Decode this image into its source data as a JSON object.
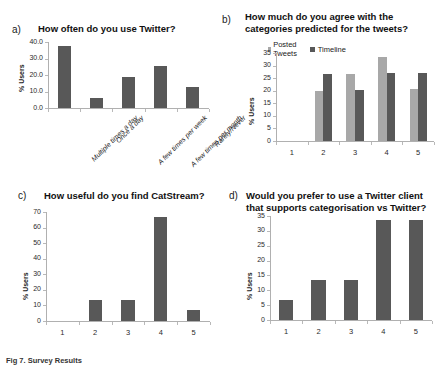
{
  "figure": {
    "caption": "Fig 7. Survey Results",
    "colors": {
      "bar_dark": "#585858",
      "bar_light": "#a8a8a8",
      "axis": "#b0b0b0",
      "text": "#1a1a1a"
    }
  },
  "panels": {
    "a": {
      "letter": "a)",
      "title": "How often do you use Twitter?"
    },
    "b": {
      "letter": "b)",
      "title_line1": "How much do you agree with the",
      "title_line2": "categories predicted for the tweets?"
    },
    "c": {
      "letter": "c)",
      "title": "How useful do you find CatStream?"
    },
    "d": {
      "letter": "d)",
      "title_line1": "Would you prefer to use a Twitter client",
      "title_line2": "that supports categorisation vs Twitter?"
    }
  },
  "chart_data": [
    {
      "id": "a",
      "type": "bar",
      "title": "How often do you use Twitter?",
      "xlabel": "",
      "ylabel": "% Users",
      "ylim": [
        0,
        40
      ],
      "yticks": [
        0,
        10,
        20,
        30,
        40
      ],
      "ytick_labels": [
        "0.0",
        "10.0",
        "20.0",
        "30.0",
        "40.0"
      ],
      "grid": false,
      "legend": null,
      "categories": [
        "Multiple times a day",
        "Once a day",
        "A few times per week",
        "A few times per month",
        "Rarely/Never"
      ],
      "values": [
        37.5,
        6.0,
        19.0,
        25.5,
        13.0
      ]
    },
    {
      "id": "b",
      "type": "bar",
      "title": "How much do you agree with the categories predicted for the tweets?",
      "xlabel": "",
      "ylabel": "% Users",
      "ylim": [
        0,
        35
      ],
      "yticks": [
        0,
        5,
        10,
        15,
        20,
        25,
        30,
        35
      ],
      "ytick_labels": [
        "0",
        "5",
        "10",
        "15",
        "20",
        "25",
        "30",
        "35"
      ],
      "grid": false,
      "legend": {
        "position": "top",
        "entries": [
          "Posted Tweets",
          "Timeline"
        ]
      },
      "categories": [
        "1",
        "2",
        "3",
        "4",
        "5"
      ],
      "series": [
        {
          "name": "Posted Tweets",
          "color": "#a8a8a8",
          "values": [
            0,
            20.0,
            26.7,
            33.5,
            20.5
          ]
        },
        {
          "name": "Timeline",
          "color": "#585858",
          "values": [
            0,
            26.8,
            20.3,
            27.0,
            27.2
          ]
        }
      ]
    },
    {
      "id": "c",
      "type": "bar",
      "title": "How useful do you find CatStream?",
      "xlabel": "",
      "ylabel": "% Users",
      "ylim": [
        0,
        70
      ],
      "yticks": [
        0,
        10,
        20,
        30,
        40,
        50,
        60,
        70
      ],
      "ytick_labels": [
        "0",
        "10",
        "20",
        "30",
        "40",
        "50",
        "60",
        "70"
      ],
      "grid": false,
      "legend": null,
      "categories": [
        "1",
        "2",
        "3",
        "4",
        "5"
      ],
      "values": [
        0,
        13.2,
        13.4,
        66.8,
        7.2
      ]
    },
    {
      "id": "d",
      "type": "bar",
      "title": "Would you prefer to use a Twitter client that supports categorisation vs Twitter?",
      "xlabel": "",
      "ylabel": "% Users",
      "ylim": [
        0,
        35
      ],
      "yticks": [
        0,
        5,
        10,
        15,
        20,
        25,
        30,
        35
      ],
      "ytick_labels": [
        "0",
        "5",
        "10",
        "15",
        "20",
        "25",
        "30",
        "35"
      ],
      "grid": false,
      "legend": null,
      "categories": [
        "1",
        "2",
        "3",
        "4",
        "5"
      ],
      "values": [
        6.7,
        13.3,
        13.4,
        33.6,
        33.7
      ]
    }
  ],
  "axis_titles": {
    "y_users": "% Users"
  }
}
